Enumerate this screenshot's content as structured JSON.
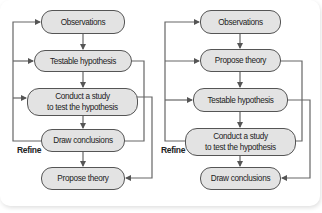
{
  "diagrams": [
    {
      "name": "linear-method",
      "nodes": [
        {
          "label": "Observations"
        },
        {
          "label": "Testable hypothesis"
        },
        {
          "label": "Conduct a study\nto test the hypothesis"
        },
        {
          "label": "Draw conclusions"
        },
        {
          "label": "Propose theory"
        }
      ],
      "loop_label": "Refine"
    },
    {
      "name": "theory-first-method",
      "nodes": [
        {
          "label": "Observations"
        },
        {
          "label": "Propose theory"
        },
        {
          "label": "Testable hypothesis"
        },
        {
          "label": "Conduct a study\nto test the hypothesis"
        },
        {
          "label": "Draw conclusions"
        }
      ],
      "loop_label": "Refine"
    }
  ],
  "colors": {
    "node_fill": "#e3e3e3",
    "node_border": "#555555",
    "line": "#666666"
  }
}
